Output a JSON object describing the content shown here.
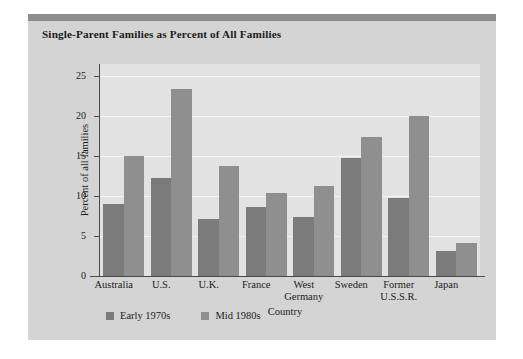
{
  "chart_data": {
    "type": "bar",
    "title": "Single-Parent Families as Percent of All Families",
    "xlabel": "Country",
    "ylabel": "Percent of all families",
    "categories": [
      "Australia",
      "U.S.",
      "U.K.",
      "France",
      "West Germany",
      "Sweden",
      "Former U.S.S.R.",
      "Japan"
    ],
    "category_lines": [
      [
        "Australia"
      ],
      [
        "U.S."
      ],
      [
        "U.K."
      ],
      [
        "France"
      ],
      [
        "West",
        "Germany"
      ],
      [
        "Sweden"
      ],
      [
        "Former",
        "U.S.S.R."
      ],
      [
        "Japan"
      ]
    ],
    "series": [
      {
        "name": "Early 1970s",
        "color": "#7b7b7b",
        "values": [
          9.0,
          12.3,
          7.1,
          8.6,
          7.4,
          14.8,
          9.8,
          3.1
        ]
      },
      {
        "name": "Mid 1980s",
        "color": "#8f8f8f",
        "values": [
          15.0,
          23.4,
          13.7,
          10.4,
          11.3,
          17.4,
          20.0,
          4.1
        ]
      }
    ],
    "ylim": [
      0,
      26.5
    ],
    "yticks": [
      0,
      5,
      10,
      15,
      20,
      25
    ],
    "ytick_labels": [
      "0",
      "5",
      "10",
      "15",
      "20",
      "25"
    ],
    "grid": true,
    "grid_color": "#f4f4f4",
    "legend_position": "bottom-left",
    "plot_background": "#e2e2e2",
    "figure_background": "#d4d4d4"
  }
}
